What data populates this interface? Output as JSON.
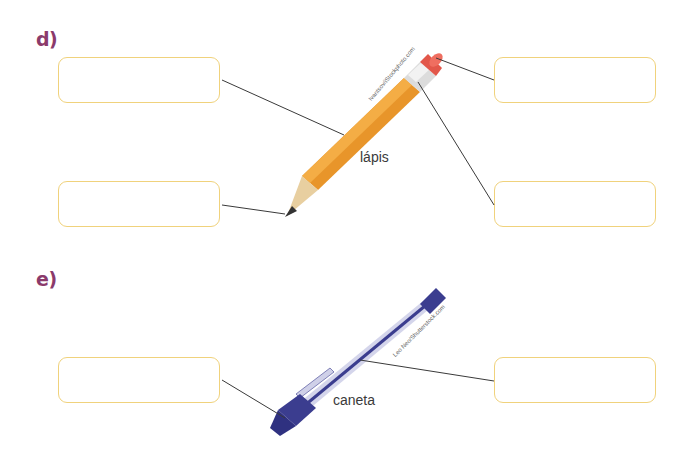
{
  "exercise_d": {
    "label": "d)",
    "item_caption": "lápis",
    "image_credit": "Ivantsov/iStockphoto.com",
    "answer_boxes": [
      {
        "position": "left-top",
        "value": ""
      },
      {
        "position": "left-bottom",
        "value": ""
      },
      {
        "position": "right-top",
        "value": ""
      },
      {
        "position": "right-bottom",
        "value": ""
      }
    ]
  },
  "exercise_e": {
    "label": "e)",
    "item_caption": "caneta",
    "image_credit": "Leo Neo/Shutterstock.com",
    "answer_boxes": [
      {
        "position": "left",
        "value": ""
      },
      {
        "position": "right",
        "value": ""
      }
    ]
  },
  "colors": {
    "label": "#8b3a6b",
    "box_border": "#f0d27c",
    "connector": "#3a3a3a",
    "pencil_body": "#e8952a",
    "pen_body": "#3b3d8f"
  }
}
